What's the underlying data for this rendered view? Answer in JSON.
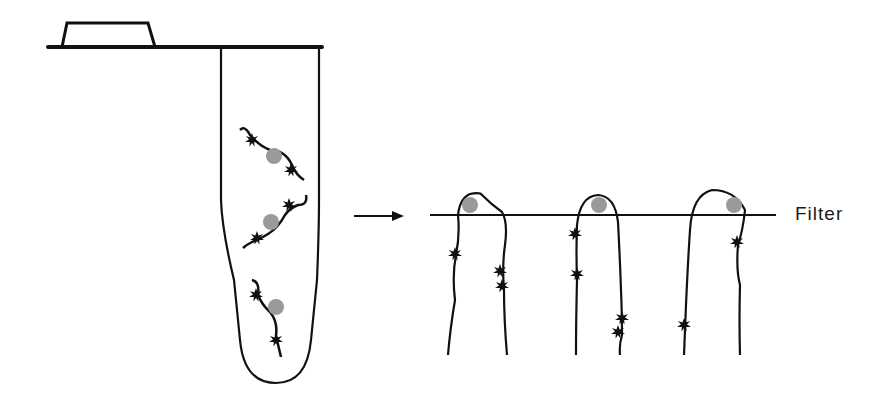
{
  "diagram": {
    "type": "filter-binding-assay-schematic",
    "stages": [
      {
        "id": "tube",
        "description": "Microcentrifuge tube containing DNA fragments with bound protein"
      },
      {
        "id": "filter",
        "description": "Protein-DNA complexes retained on filter"
      }
    ],
    "labels": {
      "filter": "Filter"
    },
    "colors": {
      "line": "#111111",
      "protein": "#9a9a9a",
      "background": "#ffffff"
    },
    "tube_fragments": 3,
    "filter_fragments": 3,
    "arrow": "right-arrow"
  }
}
